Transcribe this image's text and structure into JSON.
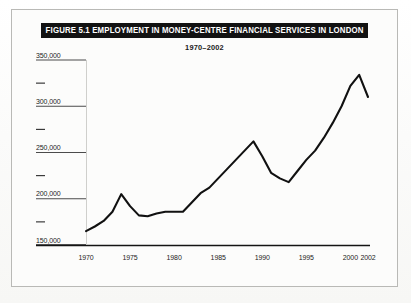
{
  "figure": {
    "title": "FIGURE 5.1  EMPLOYMENT IN MONEY-CENTRE FINANCIAL SERVICES IN LONDON",
    "subtitle": "1970–2002"
  },
  "chart_data": {
    "type": "line",
    "title": "FIGURE 5.1  EMPLOYMENT IN MONEY-CENTRE FINANCIAL SERVICES IN LONDON",
    "subtitle": "1970–2002",
    "xlabel": "",
    "ylabel": "",
    "xlim": [
      1970,
      2002
    ],
    "ylim": [
      150000,
      350000
    ],
    "grid": false,
    "legend": null,
    "line_color": "#111111",
    "x_tick_labels": [
      "1970",
      "1975",
      "1980",
      "1985",
      "1990",
      "1995",
      "2000",
      "2002"
    ],
    "x_tick_values": [
      1970,
      1975,
      1980,
      1985,
      1990,
      1995,
      2000,
      2002
    ],
    "y_tick_labels": [
      "150,000",
      "200,000",
      "250,000",
      "300,000",
      "350,000"
    ],
    "y_tick_values": [
      150000,
      200000,
      250000,
      300000,
      350000
    ],
    "y_minor_tick_values": [
      175000,
      225000,
      275000,
      325000
    ],
    "x": [
      1970,
      1971,
      1972,
      1973,
      1974,
      1975,
      1976,
      1977,
      1978,
      1979,
      1980,
      1981,
      1982,
      1983,
      1984,
      1985,
      1986,
      1987,
      1988,
      1989,
      1990,
      1991,
      1992,
      1993,
      1994,
      1995,
      1996,
      1997,
      1998,
      1999,
      2000,
      2001,
      2002
    ],
    "values": [
      165000,
      170000,
      176000,
      186000,
      205000,
      192000,
      182000,
      181000,
      184000,
      186000,
      186000,
      186000,
      196000,
      206000,
      212000,
      222000,
      232000,
      242000,
      252000,
      262000,
      246000,
      228000,
      222000,
      218000,
      230000,
      242000,
      252000,
      266000,
      282000,
      300000,
      322000,
      334000,
      310000
    ]
  }
}
